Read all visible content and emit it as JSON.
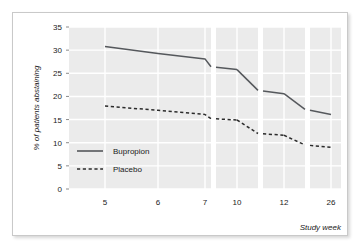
{
  "chart_data": {
    "type": "line",
    "title": "",
    "subtitle": "",
    "xlabel": "Study week",
    "ylabel": "% of patients abstaining",
    "categories": [
      "5",
      "6",
      "7",
      "10",
      "12",
      "26"
    ],
    "x_tick_labels": [
      "5",
      "6",
      "7",
      "10",
      "12",
      "26"
    ],
    "y_tick_labels": [
      "0",
      "5",
      "10",
      "15",
      "20",
      "25",
      "30",
      "35"
    ],
    "ylim": [
      0,
      35
    ],
    "y_ticks": [
      0,
      5,
      10,
      15,
      20,
      25,
      30,
      35
    ],
    "grid": true,
    "grid_color": "#ffffff",
    "plot_background": "#ebebeb",
    "legend_position": "inside-lower-left",
    "panel_breaks": true,
    "series": [
      {
        "name": "Bupropion",
        "style": "solid",
        "color": "#55585c",
        "values": [
          30.8,
          29.3,
          28.1,
          25.8,
          20.6,
          16.1
        ],
        "points": [
          {
            "x": "5",
            "y": 30.8
          },
          {
            "x": "6",
            "y": 29.3
          },
          {
            "x": "7",
            "y": 28.1
          },
          {
            "x": "7+",
            "y": 26.4
          },
          {
            "x": "10",
            "y": 25.8
          },
          {
            "x": "10+",
            "y": 21.3
          },
          {
            "x": "12",
            "y": 20.6
          },
          {
            "x": "12+",
            "y": 17.2
          },
          {
            "x": "26",
            "y": 16.1
          }
        ]
      },
      {
        "name": "Placebo",
        "style": "dashed",
        "color": "#2b2b2b",
        "values": [
          17.9,
          17.0,
          16.1,
          14.9,
          11.6,
          9.0
        ],
        "points": [
          {
            "x": "5",
            "y": 17.9
          },
          {
            "x": "6",
            "y": 17.0
          },
          {
            "x": "7",
            "y": 16.1
          },
          {
            "x": "7+",
            "y": 15.2
          },
          {
            "x": "10",
            "y": 14.9
          },
          {
            "x": "10+",
            "y": 12.0
          },
          {
            "x": "12",
            "y": 11.6
          },
          {
            "x": "12+",
            "y": 9.5
          },
          {
            "x": "26",
            "y": 9.0
          }
        ]
      }
    ]
  },
  "legend": {
    "items": [
      {
        "label": "Bupropion",
        "style": "solid"
      },
      {
        "label": "Placebo",
        "style": "dashed"
      }
    ]
  },
  "axes": {
    "y_title": "% of patients abstaining",
    "x_title": "Study week",
    "y_ticks": [
      "35",
      "30",
      "25",
      "20",
      "15",
      "10",
      "5",
      "0"
    ],
    "x_ticks": [
      "5",
      "6",
      "7",
      "10",
      "12",
      "26"
    ]
  }
}
